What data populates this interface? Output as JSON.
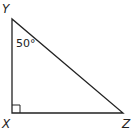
{
  "diagram": {
    "type": "right-triangle",
    "vertices": {
      "Y": {
        "label": "Y",
        "x": 12,
        "y": 19
      },
      "X": {
        "label": "X",
        "x": 12,
        "y": 113
      },
      "Z": {
        "label": "Z",
        "x": 123,
        "y": 113
      }
    },
    "angle_annotation": {
      "vertex": "Y",
      "text": "50°"
    },
    "right_angle_at": "X",
    "stroke_color": "#222222"
  }
}
